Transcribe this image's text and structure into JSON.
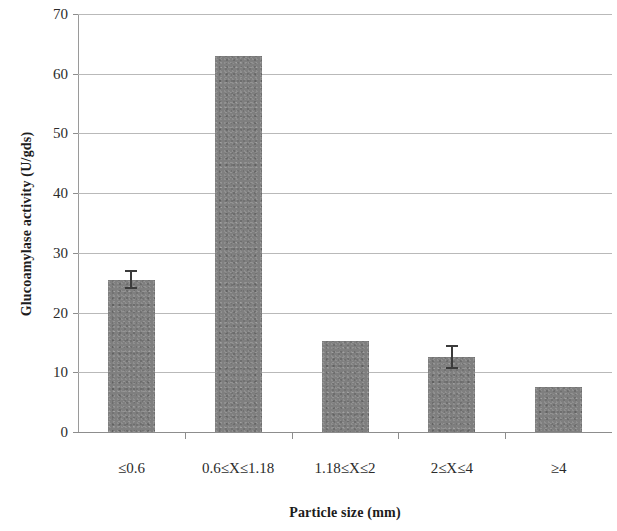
{
  "chart_data": {
    "type": "bar",
    "title": "",
    "xlabel": "Particle size (mm)",
    "ylabel": "Glucoamylase activity (U/gds)",
    "categories": [
      "≤0.6",
      "0.6≤X≤1.18",
      "1.18≤X≤2",
      "2≤X≤4",
      "≥4"
    ],
    "values": [
      25.5,
      63.0,
      15.2,
      12.5,
      7.5
    ],
    "errors": [
      1.6,
      0,
      0,
      2.0,
      0
    ],
    "ylim": [
      0,
      70
    ],
    "ytick_labels": [
      "0",
      "10",
      "20",
      "30",
      "40",
      "50",
      "60",
      "70"
    ],
    "ytick_values": [
      0,
      10,
      20,
      30,
      40,
      50,
      60,
      70
    ],
    "grid": true,
    "legend": null,
    "bar_color": "#7f7f7f",
    "grid_color": "#b9b9b9",
    "axis_color": "#8d8d8d",
    "error_bar_color": "#3b3b3b"
  }
}
